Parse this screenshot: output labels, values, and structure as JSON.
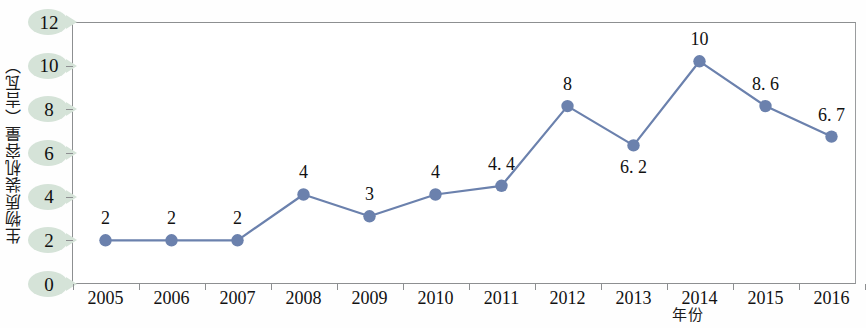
{
  "chart_data": {
    "type": "line",
    "title": "",
    "xlabel": "年份",
    "ylabel": "生物质装机容量（吉瓦）",
    "categories": [
      "2005",
      "2006",
      "2007",
      "2008",
      "2009",
      "2010",
      "2011",
      "2012",
      "2013",
      "2014",
      "2015",
      "2016"
    ],
    "values": [
      2,
      2,
      2,
      4.1,
      3.1,
      4.1,
      4.5,
      8.15,
      6.35,
      10.2,
      8.15,
      6.75
    ],
    "point_labels": [
      "2",
      "2",
      "2",
      "4",
      "3",
      "4",
      "4. 4",
      "8",
      "6. 2",
      "10",
      "8. 6",
      "6. 7"
    ],
    "label_positions": [
      "above",
      "above",
      "above",
      "above",
      "above",
      "above",
      "above",
      "above",
      "below",
      "above",
      "above",
      "above"
    ],
    "ylim": [
      0,
      12
    ],
    "yticks": [
      0,
      2,
      4,
      6,
      8,
      10,
      12
    ],
    "ytick_labels": [
      "0",
      "2",
      "4",
      "6",
      "8",
      "10",
      "12"
    ],
    "grid": false,
    "legend": "none",
    "series_color": "#6b81ad",
    "marker_color": "#6b81ad",
    "ytick_highlight_color": "#d5e3d8",
    "axis_color": "#8d8f91"
  }
}
